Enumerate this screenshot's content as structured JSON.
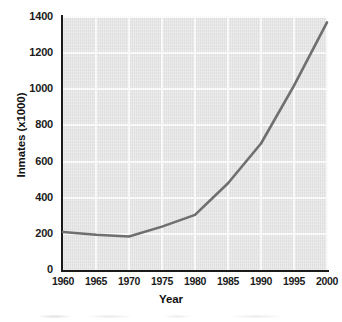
{
  "chart_data": {
    "type": "line",
    "title": "",
    "xlabel": "Year",
    "ylabel": "Inmates (x1000)",
    "x": [
      1960,
      1965,
      1970,
      1975,
      1980,
      1985,
      1990,
      1995,
      2000
    ],
    "values": [
      210,
      195,
      185,
      240,
      305,
      480,
      700,
      1020,
      1370
    ],
    "series": [
      {
        "name": "Inmates",
        "values": [
          210,
          195,
          185,
          240,
          305,
          480,
          700,
          1020,
          1370
        ]
      }
    ],
    "xlim": [
      1960,
      2000
    ],
    "ylim": [
      0,
      1400
    ],
    "xticks": [
      "1960",
      "1965",
      "1970",
      "1975",
      "1980",
      "1985",
      "1990",
      "1995",
      "2000"
    ],
    "yticks": [
      "0",
      "200",
      "400",
      "600",
      "800",
      "1000",
      "1200",
      "1400"
    ],
    "grid": true,
    "legend": false,
    "legend_position": "none",
    "colors": {
      "line": "#6f6f6f",
      "plot_background": "#e4e4e4",
      "gridline": "#fbfbfb",
      "axis": "#1a1a1a",
      "text": "#1b1b1b",
      "figure_background": "#ffffff"
    }
  }
}
